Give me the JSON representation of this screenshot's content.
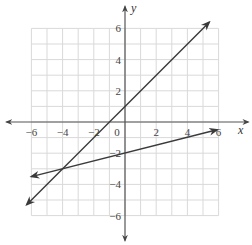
{
  "chart_data": {
    "type": "line",
    "title": "",
    "xlabel": "x",
    "ylabel": "y",
    "xlim": [
      -6,
      6
    ],
    "ylim": [
      -6,
      6
    ],
    "grid": true,
    "x_ticks": [
      -6,
      -4,
      -2,
      0,
      2,
      4,
      6
    ],
    "y_ticks": [
      -6,
      -4,
      -2,
      2,
      4,
      6
    ],
    "x_tick_labels": [
      "−6",
      "−4",
      "−2",
      "0",
      "2",
      "4",
      "6"
    ],
    "y_tick_labels": [
      "−6",
      "−4",
      "−2",
      "2",
      "4",
      "6"
    ],
    "series": [
      {
        "name": "line-a",
        "equation": "y = x + 1",
        "slope": 1,
        "intercept": 1,
        "x": [
          -6.3,
          5.4
        ],
        "y": [
          -5.3,
          6.4
        ],
        "arrows": "both"
      },
      {
        "name": "line-b",
        "equation": "y = x/4 - 2",
        "slope": 0.25,
        "intercept": -2,
        "x": [
          -6.0,
          5.9
        ],
        "y": [
          -3.5,
          -0.5
        ],
        "arrows": "both"
      }
    ],
    "intersection": {
      "x": -4,
      "y": -3
    }
  },
  "labels": {
    "x_axis": "x",
    "y_axis": "y",
    "origin": "0"
  },
  "colors": {
    "axis": "#555555",
    "grid": "#d9d9d9",
    "line": "#3a3a3a"
  }
}
